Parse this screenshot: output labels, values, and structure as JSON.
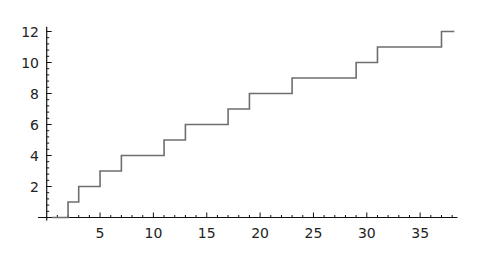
{
  "chart_data": {
    "type": "line",
    "subtype": "step",
    "title": "",
    "xlabel": "",
    "ylabel": "",
    "xlim": [
      0,
      38.5
    ],
    "ylim": [
      0,
      12
    ],
    "grid": false,
    "legend": null,
    "x_ticks": [
      5,
      10,
      15,
      20,
      25,
      30,
      35
    ],
    "y_ticks": [
      2,
      4,
      6,
      8,
      10,
      12
    ],
    "x_tick_labels": [
      "5",
      "10",
      "15",
      "20",
      "25",
      "30",
      "35"
    ],
    "y_tick_labels": [
      "2",
      "4",
      "6",
      "8",
      "10",
      "12"
    ],
    "series": [
      {
        "name": "step",
        "color": "#6e6e6e",
        "step_x": [
          2,
          3,
          5,
          7,
          11,
          13,
          17,
          19,
          23,
          29,
          31,
          37
        ],
        "step_y": [
          1,
          2,
          3,
          4,
          5,
          6,
          7,
          8,
          9,
          10,
          11,
          12
        ],
        "x_start": 0.5,
        "x_end": 38.2
      }
    ]
  }
}
